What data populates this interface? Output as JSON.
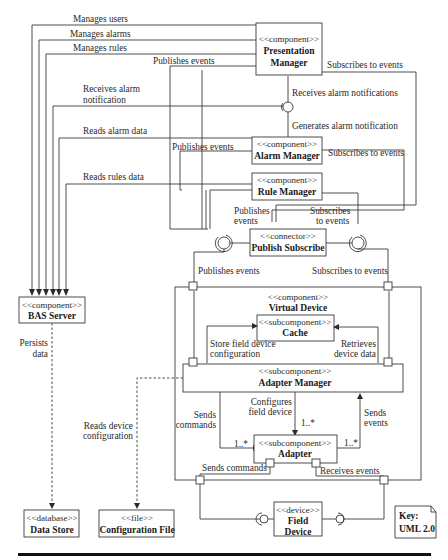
{
  "diagram": {
    "type": "UML component diagram",
    "components": {
      "presentation_manager": {
        "stereotype": "<<component>>",
        "name_line1": "Presentation",
        "name_line2": "Manager"
      },
      "alarm_manager": {
        "stereotype": "<<component>>",
        "name": "Alarm Manager"
      },
      "rule_manager": {
        "stereotype": "<<component>>",
        "name": "Rule Manager"
      },
      "publish_subscribe": {
        "stereotype": "<<connector>>",
        "name": "Publish Subscribe"
      },
      "bas_server": {
        "stereotype": "<<component>>",
        "name": "BAS Server"
      },
      "virtual_device": {
        "stereotype": "<<component>>",
        "name": "Virtual Device"
      },
      "cache": {
        "stereotype": "<<subcomponent>>",
        "name": "Cache"
      },
      "adapter_manager": {
        "stereotype": "<<subcomponent>>",
        "name": "Adapter Manager"
      },
      "adapter": {
        "stereotype": "<<subcomponent>>",
        "name": "Adapter"
      },
      "data_store": {
        "stereotype": "<<database>>",
        "name": "Data Store"
      },
      "configuration_file": {
        "stereotype": "<<file>>",
        "name": "Configuration File"
      },
      "field_device": {
        "stereotype": "<<device>>",
        "name_line1": "Field",
        "name_line2": "Device"
      }
    },
    "labels": {
      "manages_users": "Manages users",
      "manages_alarms": "Manages alarms",
      "manages_rules": "Manages rules",
      "receives_alarm_notification_1": "Receives alarm",
      "receives_alarm_notification_2": "notification",
      "reads_alarm_data": "Reads alarm data",
      "reads_rules_data": "Reads rules data",
      "pm_publishes_events": "Publishes events",
      "pm_subscribes_to_events": "Subscribes to events",
      "receives_alarm_notifications": "Receives alarm notifications",
      "generates_alarm_notification": "Generates alarm notification",
      "am_publishes_events": "Publishes events",
      "am_subscribes_to_events": "Subscribes to events",
      "rm_publishes_1": "Publishes",
      "rm_publishes_2": "events",
      "rm_subscribes_1": "Subscribes",
      "rm_subscribes_2": "to events",
      "vd_publishes_events": "Publishes events",
      "vd_subscribes_to_events": "Subscribes to events",
      "persists_1": "Persists",
      "persists_2": "data",
      "store_config_1": "Store field device",
      "store_config_2": "configuration",
      "retrieves_1": "Retrieves",
      "retrieves_2": "device data",
      "reads_device_config_1": "Reads device",
      "reads_device_config_2": "configuration",
      "configures_1": "Configures",
      "configures_2": "field device",
      "sends_commands_1": "Sends",
      "sends_commands_2": "commands",
      "sends_events_1": "Sends",
      "sends_events_2": "events",
      "mult_left": "1..*",
      "mult_top": "1..*",
      "mult_right": "1..*",
      "adapter_sends_commands": "Sends commands",
      "adapter_receives_events": "Receives events"
    },
    "key": {
      "line1": "Key:",
      "line2": "UML 2.0"
    }
  }
}
